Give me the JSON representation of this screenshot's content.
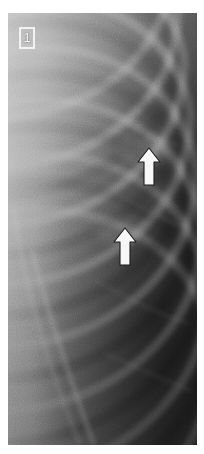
{
  "figure": {
    "domain": "medical-radiograph",
    "modality": "chest-radiograph",
    "panel_label": "1",
    "region": "right upper and mid lung zone, lateral costal margin",
    "background_color": "#ffffff"
  },
  "plate": {
    "name": "chest-xray-image",
    "x": 8,
    "y": 13,
    "width": 189,
    "height": 432,
    "tone_light": "#9a9a9a",
    "tone_mid": "#6e6e6e",
    "tone_dark": "#3a3a3a",
    "tone_darkest": "#232323",
    "description": "Coned-down grayscale chest radiograph showing obliquely oriented ribs crossing from upper left to lower right, a bright soft-tissue/chest-wall band along the left margin, and progressively darker aerated lung toward the right and inferior aspect."
  },
  "label_box": {
    "name": "panel-label",
    "text": "1",
    "border_color": "#f2f2f2",
    "text_color": "#f4f4f4",
    "x": 11,
    "y": 14,
    "width": 16,
    "height": 22
  },
  "annotations": {
    "arrow_color": "#f7f7f7",
    "arrow_outline_color": "#1c1c1c",
    "items": [
      {
        "name": "annotation-arrow-upper",
        "direction": "up",
        "tip_x": 141,
        "tip_y": 148,
        "tail_y": 182,
        "width": 17,
        "height": 34,
        "points_at": "upper lesion / pleural-based opacity"
      },
      {
        "name": "annotation-arrow-lower",
        "direction": "up",
        "tip_x": 117,
        "tip_y": 228,
        "tail_y": 261,
        "width": 17,
        "height": 33,
        "points_at": "lower lesion / pleural-based opacity"
      }
    ]
  },
  "anatomy_overlays": {
    "ribs": [
      {
        "name": "rib-1",
        "cy": -20,
        "rx": 150,
        "ry": 120,
        "thickness": 9,
        "opacity": 0.3
      },
      {
        "name": "rib-2",
        "cy": 22,
        "rx": 158,
        "ry": 128,
        "thickness": 9,
        "opacity": 0.32
      },
      {
        "name": "rib-3",
        "cy": 74,
        "rx": 164,
        "ry": 134,
        "thickness": 9,
        "opacity": 0.32
      },
      {
        "name": "rib-4",
        "cy": 128,
        "rx": 170,
        "ry": 140,
        "thickness": 9,
        "opacity": 0.3
      },
      {
        "name": "rib-5",
        "cy": 184,
        "rx": 176,
        "ry": 146,
        "thickness": 9,
        "opacity": 0.28
      },
      {
        "name": "rib-6",
        "cy": 242,
        "rx": 182,
        "ry": 152,
        "thickness": 9,
        "opacity": 0.26
      },
      {
        "name": "rib-7",
        "cy": 302,
        "rx": 188,
        "ry": 158,
        "thickness": 9,
        "opacity": 0.24
      },
      {
        "name": "rib-8",
        "cy": 364,
        "rx": 194,
        "ry": 164,
        "thickness": 9,
        "opacity": 0.22
      }
    ],
    "scapular_edge": {
      "name": "scapular-border-line",
      "x1": 28,
      "y1": 250,
      "x2": 92,
      "y2": 432,
      "thickness": 5,
      "opacity": 0.34
    },
    "chest_wall_band": {
      "name": "chest-wall-soft-tissue-band",
      "x": 0,
      "width": 52,
      "opacity": 0.55
    }
  }
}
